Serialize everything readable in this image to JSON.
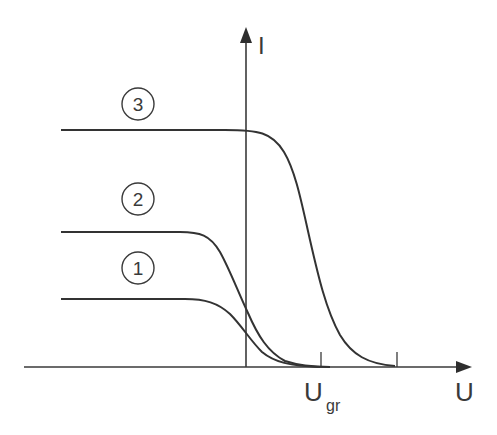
{
  "figure": {
    "type": "I-U characteristic diagram",
    "axes": {
      "y_label": "I",
      "x_label": "U",
      "x_tick_label_main": "U",
      "x_tick_label_sub": "gr"
    },
    "curves": [
      {
        "id": "1",
        "label": "1",
        "level": "lowest plateau"
      },
      {
        "id": "2",
        "label": "2",
        "level": "middle plateau"
      },
      {
        "id": "3",
        "label": "3",
        "level": "highest plateau"
      }
    ],
    "colors": {
      "line": "#3a3a3a",
      "background": "#ffffff"
    }
  }
}
